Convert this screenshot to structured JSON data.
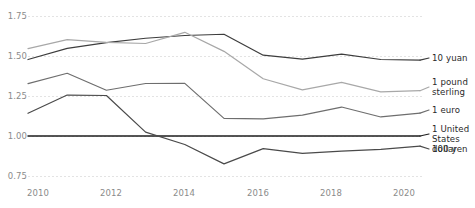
{
  "chart_data": {
    "type": "line",
    "title": "",
    "subtitle": "",
    "xlabel": "",
    "ylabel": "",
    "xlim": [
      2010,
      2020.6
    ],
    "ylim": [
      0.75,
      1.75
    ],
    "grid": true,
    "legend_position": "right",
    "x": [
      2010,
      2011,
      2012,
      2013,
      2014,
      2015,
      2016,
      2017,
      2018,
      2019,
      2020
    ],
    "y_ticks": [
      "1.75",
      "1.50",
      "1.25",
      "1.00",
      "0.75"
    ],
    "y_tick_values": [
      1.75,
      1.5,
      1.25,
      1.0,
      0.75
    ],
    "x_ticks": [
      "2010",
      "2012",
      "2014",
      "2016",
      "2018",
      "2020"
    ],
    "x_tick_values": [
      2010,
      2012,
      2014,
      2016,
      2018,
      2020
    ],
    "series": [
      {
        "name": "10 yuan",
        "color": "#3d3d3d",
        "values": [
          1.478,
          1.548,
          1.584,
          1.611,
          1.628,
          1.636,
          1.505,
          1.481,
          1.512,
          1.478,
          1.474
        ]
      },
      {
        "name": "1 pound sterling",
        "color": "#a8a8a8",
        "values": [
          1.546,
          1.602,
          1.585,
          1.578,
          1.648,
          1.529,
          1.358,
          1.288,
          1.335,
          1.276,
          1.283
        ]
      },
      {
        "name": "1 euro",
        "color": "#6e6e6e",
        "values": [
          1.327,
          1.392,
          1.286,
          1.328,
          1.329,
          1.11,
          1.107,
          1.13,
          1.181,
          1.119,
          1.143
        ]
      },
      {
        "name": "1 United States dollar",
        "color": "#1f1f1f",
        "values": [
          1.0,
          1.0,
          1.0,
          1.0,
          1.0,
          1.0,
          1.0,
          1.0,
          1.0,
          1.0,
          1.0
        ]
      },
      {
        "name": "100 yen",
        "color": "#4a4a4a",
        "values": [
          1.142,
          1.256,
          1.253,
          1.024,
          0.947,
          0.826,
          0.921,
          0.892,
          0.906,
          0.917,
          0.937
        ]
      }
    ],
    "legend_entries": [
      {
        "label": "10 yuan",
        "color": "#3d3d3d"
      },
      {
        "label": "1 pound\nsterling",
        "color": "#a8a8a8"
      },
      {
        "label": "1 euro",
        "color": "#6e6e6e"
      },
      {
        "label": "1 United\nStates dollar",
        "color": "#1f1f1f"
      },
      {
        "label": "100 yen",
        "color": "#4a4a4a"
      }
    ]
  },
  "axes": {
    "y_tick_0": "1.75",
    "y_tick_1": "1.50",
    "y_tick_2": "1.25",
    "y_tick_3": "1.00",
    "y_tick_4": "0.75",
    "x_tick_0": "2010",
    "x_tick_1": "2012",
    "x_tick_2": "2014",
    "x_tick_3": "2016",
    "x_tick_4": "2018",
    "x_tick_5": "2020"
  },
  "legend": {
    "item_0": "10 yuan",
    "item_1": "1 pound\nsterling",
    "item_2": "1 euro",
    "item_3": "1 United\nStates dollar",
    "item_4": "100 yen"
  },
  "colors": {
    "gridline": "#e3e3e3",
    "axis_text": "#8b8b8b",
    "legend_text": "#2a2a2a",
    "background": "#ffffff"
  }
}
